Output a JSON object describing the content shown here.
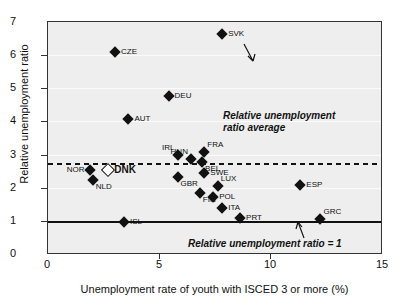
{
  "chart_data": {
    "type": "scatter",
    "title": "",
    "xlabel": "Unemployment rate of youth  with ISCED 3 or more (%)",
    "ylabel": "Relative unemployment ratio",
    "xlim": [
      0,
      15
    ],
    "ylim": [
      0,
      7
    ],
    "xticks": [
      "0",
      "5",
      "10",
      "15"
    ],
    "xtick_values": [
      0,
      5,
      10,
      15
    ],
    "yticks": [
      "0",
      "1",
      "2",
      "3",
      "4",
      "5",
      "6",
      "7"
    ],
    "ytick_values": [
      0,
      1,
      2,
      3,
      4,
      5,
      6,
      7
    ],
    "grid": true,
    "legend": "none",
    "points": [
      {
        "label": "SVK",
        "x": 7.8,
        "y": 6.65,
        "marker": "filled-diamond",
        "label_pos": "r"
      },
      {
        "label": "CZE",
        "x": 3.0,
        "y": 6.1,
        "marker": "filled-diamond",
        "label_pos": "r"
      },
      {
        "label": "DEU",
        "x": 5.4,
        "y": 4.77,
        "marker": "filled-diamond",
        "label_pos": "r"
      },
      {
        "label": "AUT",
        "x": 3.6,
        "y": 4.1,
        "marker": "filled-diamond",
        "label_pos": "r"
      },
      {
        "label": "FRA",
        "x": 7.0,
        "y": 3.08,
        "marker": "filled-diamond",
        "label_pos": "tr"
      },
      {
        "label": "IRL",
        "x": 5.8,
        "y": 3.0,
        "marker": "filled-diamond",
        "label_pos": "tl"
      },
      {
        "label": "HUN",
        "x": 6.4,
        "y": 2.87,
        "marker": "filled-diamond",
        "label_pos": "tl"
      },
      {
        "label": "BEL",
        "x": 6.9,
        "y": 2.78,
        "marker": "filled-diamond",
        "label_pos": "br"
      },
      {
        "label": "DNK",
        "x": 2.7,
        "y": 2.54,
        "marker": "open-diamond",
        "label_pos": "r"
      },
      {
        "label": "NOR",
        "x": 1.9,
        "y": 2.54,
        "marker": "filled-diamond",
        "label_pos": "l"
      },
      {
        "label": "SWE",
        "x": 7.0,
        "y": 2.45,
        "marker": "filled-diamond",
        "label_pos": "r"
      },
      {
        "label": "GBR",
        "x": 5.8,
        "y": 2.33,
        "marker": "filled-diamond",
        "label_pos": "br"
      },
      {
        "label": "NLD",
        "x": 2.0,
        "y": 2.24,
        "marker": "filled-diamond",
        "label_pos": "br"
      },
      {
        "label": "ESP",
        "x": 11.3,
        "y": 2.1,
        "marker": "filled-diamond",
        "label_pos": "r"
      },
      {
        "label": "LUX",
        "x": 7.6,
        "y": 2.06,
        "marker": "filled-diamond",
        "label_pos": "tr"
      },
      {
        "label": "FIN",
        "x": 6.8,
        "y": 1.87,
        "marker": "filled-diamond",
        "label_pos": "br"
      },
      {
        "label": "POL",
        "x": 7.4,
        "y": 1.75,
        "marker": "filled-diamond",
        "label_pos": "r"
      },
      {
        "label": "ITA",
        "x": 7.8,
        "y": 1.42,
        "marker": "filled-diamond",
        "label_pos": "r"
      },
      {
        "label": "PRT",
        "x": 8.6,
        "y": 1.12,
        "marker": "filled-diamond",
        "label_pos": "r"
      },
      {
        "label": "GRC",
        "x": 12.2,
        "y": 1.09,
        "marker": "filled-diamond",
        "label_pos": "tr"
      },
      {
        "label": "ISL",
        "x": 3.4,
        "y": 0.98,
        "marker": "filled-diamond",
        "label_pos": "r"
      }
    ],
    "reference_lines": [
      {
        "name": "average",
        "y": 2.75,
        "style": "dashed",
        "annotation": "Relative unemployment\nratio average"
      },
      {
        "name": "unity",
        "y": 1.0,
        "style": "solid",
        "annotation": "Relative unemployment ratio = 1"
      }
    ],
    "annotations": {
      "average_line_1": "Relative unemployment",
      "average_line_2": "ratio average",
      "unity_line": "Relative unemployment ratio = 1"
    }
  }
}
